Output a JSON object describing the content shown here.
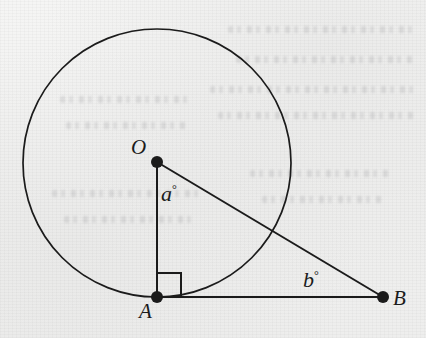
{
  "figure": {
    "background_color": "#f1f1f0",
    "ink_color": "#1b1b1b",
    "labels": {
      "center_point": "O",
      "tangent_point": "A",
      "external_point": "B",
      "central_angle": "a",
      "external_angle": "b",
      "degree_symbol": "°"
    },
    "geometry": {
      "circle": {
        "cx": 157,
        "cy": 163,
        "r": 134
      },
      "points": [
        {
          "name": "O",
          "x": 157,
          "y": 162,
          "dot_radius": 6
        },
        {
          "name": "A",
          "x": 157,
          "y": 297,
          "dot_radius": 6
        },
        {
          "name": "B",
          "x": 383,
          "y": 297,
          "dot_radius": 6
        }
      ],
      "segments": [
        {
          "name": "OA",
          "from": "O",
          "to": "A"
        },
        {
          "name": "AB",
          "from": "A",
          "to": "B"
        },
        {
          "name": "OB",
          "from": "O",
          "to": "B"
        }
      ],
      "right_angle_marker": {
        "at": "A",
        "size": 24
      },
      "chord_intersection": {
        "x": 270,
        "y": 231
      }
    },
    "label_positions": {
      "O": {
        "x": 131,
        "y": 137
      },
      "A": {
        "x": 139,
        "y": 301
      },
      "B": {
        "x": 393,
        "y": 288
      },
      "a": {
        "x": 161,
        "y": 183
      },
      "b": {
        "x": 303,
        "y": 269
      }
    },
    "ghost_text_lines": [
      {
        "x": 228,
        "y": 26,
        "w": 190
      },
      {
        "x": 236,
        "y": 56,
        "w": 180
      },
      {
        "x": 210,
        "y": 86,
        "w": 205
      },
      {
        "x": 218,
        "y": 112,
        "w": 196
      },
      {
        "x": 60,
        "y": 96,
        "w": 132
      },
      {
        "x": 66,
        "y": 122,
        "w": 120
      },
      {
        "x": 52,
        "y": 190,
        "w": 150
      },
      {
        "x": 64,
        "y": 216,
        "w": 128
      },
      {
        "x": 250,
        "y": 170,
        "w": 140
      },
      {
        "x": 262,
        "y": 196,
        "w": 120
      }
    ]
  }
}
